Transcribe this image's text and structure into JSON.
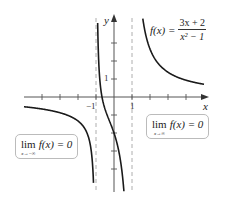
{
  "chart_data": {
    "type": "line",
    "title": "",
    "function": "f(x) = (3x + 2) / (x^2 - 1)",
    "xlabel": "x",
    "ylabel": "y",
    "xlim": [
      -5,
      5
    ],
    "ylim": [
      -5,
      4
    ],
    "grid": false,
    "x_tick_labels": [
      {
        "value": -1,
        "label": "−1"
      },
      {
        "value": 1,
        "label": "1"
      }
    ],
    "y_tick_labels": [
      {
        "value": 1,
        "label": "1"
      }
    ],
    "x_ticks": [
      -4,
      -3,
      -2,
      -1,
      1,
      2,
      3,
      4
    ],
    "y_ticks": [
      -4,
      -3,
      -2,
      -1,
      1,
      2,
      3
    ],
    "vertical_asymptotes": [
      -1,
      1
    ],
    "horizontal_asymptote": 0,
    "series": [
      {
        "name": "left branch",
        "x_range": [
          -5,
          -1.06
        ]
      },
      {
        "name": "middle branch",
        "x_range": [
          -0.93,
          0.55
        ]
      },
      {
        "name": "right branch",
        "x_range": [
          1.6,
          5
        ]
      }
    ],
    "annotations": [
      {
        "text": "f(x) = (3x + 2)/(x² − 1)",
        "position": "top-right"
      },
      {
        "text": "lim x→−∞ f(x) = 0",
        "position": "lower-left"
      },
      {
        "text": "lim x→∞ f(x) = 0",
        "position": "right"
      }
    ]
  },
  "labels": {
    "x_axis": "x",
    "y_axis": "y",
    "tick_neg1": "−1",
    "tick_pos1": "1",
    "tick_y1": "1"
  },
  "formula": {
    "lhs": "f(x) =",
    "numerator": "3x + 2",
    "denominator": "x² − 1"
  },
  "limit_left": {
    "lim": "lim",
    "sub": "x→−∞",
    "expr": "f(x) = 0"
  },
  "limit_right": {
    "lim": "lim",
    "sub": "x→∞",
    "expr": "f(x) = 0"
  },
  "colors": {
    "curve": "#1a1a1a",
    "axis": "#555555",
    "asymptote": "#999999"
  }
}
